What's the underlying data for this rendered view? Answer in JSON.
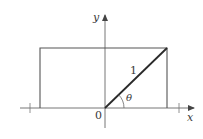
{
  "figure": {
    "type": "geometry-diagram",
    "axes": {
      "x_label": "x",
      "y_label": "y",
      "origin_label": "0"
    },
    "segment": {
      "length_label": "1",
      "angle_label": "θ"
    },
    "colors": {
      "stroke": "#555555",
      "segment": "#2a2a2a",
      "text": "#3a3a3a"
    }
  }
}
